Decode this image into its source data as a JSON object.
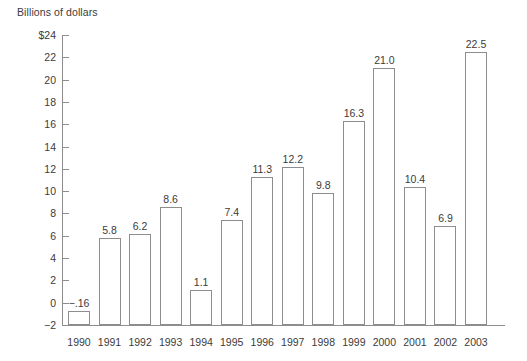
{
  "chart_data": {
    "type": "bar",
    "title": "",
    "ylabel": "Billions of dollars",
    "xlabel": "",
    "categories": [
      "1990",
      "1991",
      "1992",
      "1993",
      "1994",
      "1995",
      "1996",
      "1997",
      "1998",
      "1999",
      "2000",
      "2001",
      "2002",
      "2003"
    ],
    "values": [
      -0.16,
      5.8,
      6.2,
      8.6,
      1.1,
      7.4,
      11.3,
      12.2,
      9.8,
      16.3,
      21.0,
      10.4,
      6.9,
      22.5
    ],
    "value_labels": [
      "−.16",
      "5.8",
      "6.2",
      "8.6",
      "1.1",
      "7.4",
      "11.3",
      "12.2",
      "9.8",
      "16.3",
      "21.0",
      "10.4",
      "6.9",
      "22.5"
    ],
    "ylim": [
      -2,
      24
    ],
    "ytick_values": [
      24,
      22,
      20,
      18,
      16,
      14,
      12,
      10,
      8,
      6,
      4,
      2,
      0,
      -2
    ],
    "ytick_labels": [
      "$24",
      "22",
      "20",
      "18",
      "16",
      "14",
      "12",
      "10",
      "8",
      "6",
      "4",
      "2",
      "0",
      "−2"
    ],
    "grid": false,
    "legend": "none",
    "bar_fill": "#ffffff",
    "bar_stroke": "#8d8d8d",
    "text_color": "#3b3b3b"
  }
}
